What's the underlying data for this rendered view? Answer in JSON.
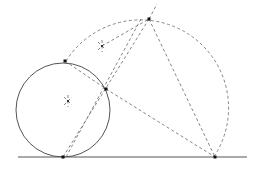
{
  "diagram": {
    "type": "geometric-construction",
    "colors": {
      "solid": "#555555",
      "dashed": "#777777",
      "point": "#111111",
      "background": "#ffffff"
    },
    "baseline": {
      "x1": 18,
      "y1": 157,
      "x2": 247,
      "y2": 157
    },
    "small_circle": {
      "cx": 63,
      "cy": 110,
      "r": 47
    },
    "large_dashed_arc": {
      "cx": 150,
      "cy": 98,
      "r": 80
    },
    "points": [
      {
        "name": "tangent-point",
        "x": 63,
        "y": 157
      },
      {
        "name": "circle-top-point",
        "x": 65,
        "y": 61
      },
      {
        "name": "circle-right-point",
        "x": 106,
        "y": 89
      },
      {
        "name": "apex-point",
        "x": 149,
        "y": 19
      },
      {
        "name": "base-right-point",
        "x": 215,
        "y": 157
      },
      {
        "name": "center-marker",
        "x": 68,
        "y": 101
      },
      {
        "name": "upper-marker",
        "x": 102,
        "y": 46
      }
    ],
    "dashed_lines": [
      {
        "name": "apex-to-base-right",
        "x1": 149,
        "y1": 19,
        "x2": 215,
        "y2": 157
      },
      {
        "name": "apex-extension",
        "x1": 149,
        "y1": 19,
        "x2": 157,
        "y2": 4
      },
      {
        "name": "circle-right-to-base-right",
        "x1": 106,
        "y1": 89,
        "x2": 215,
        "y2": 157
      },
      {
        "name": "apex-to-tangent-a",
        "x1": 149,
        "y1": 19,
        "x2": 63,
        "y2": 157
      },
      {
        "name": "apex-to-tangent-b",
        "x1": 141,
        "y1": 19,
        "x2": 66,
        "y2": 157
      },
      {
        "name": "circle-top-to-right",
        "x1": 65,
        "y1": 61,
        "x2": 106,
        "y2": 89
      },
      {
        "name": "upper-marker-to-apex",
        "x1": 102,
        "y1": 46,
        "x2": 149,
        "y2": 19
      }
    ]
  }
}
